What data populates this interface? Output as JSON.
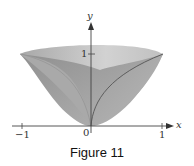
{
  "figure": {
    "caption": "Figure 11",
    "axes": {
      "x_label": "x",
      "y_label": "y",
      "origin_label": "0",
      "x_ticks": [
        {
          "value": -1,
          "label": "−1"
        },
        {
          "value": 1,
          "label": "1"
        }
      ],
      "y_ticks": [
        {
          "value": 1,
          "label": "1"
        }
      ]
    },
    "curves": [
      {
        "name": "y = sqrt(x)",
        "from": [
          0,
          0
        ],
        "to": [
          1,
          1
        ]
      },
      {
        "name": "bowl rim",
        "from": [
          -1,
          1
        ],
        "to": [
          1,
          1
        ]
      }
    ],
    "colors": {
      "surface_dark": "#9c9c9c",
      "surface_mid": "#b0b0b0",
      "surface_light": "#cbcbcb",
      "edge": "#5a5a5a",
      "axis": "#444444"
    }
  }
}
